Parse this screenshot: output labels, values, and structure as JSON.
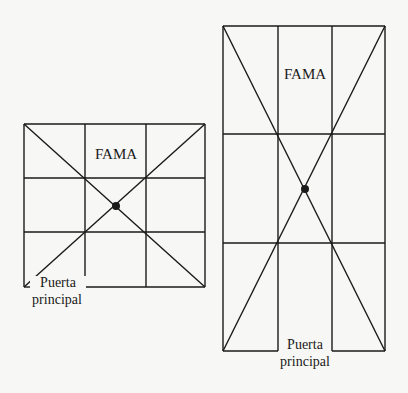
{
  "diagrams": [
    {
      "name": "square-plan",
      "top_label": "FAMA",
      "door_label_line1": "Puerta",
      "door_label_line2": "principal"
    },
    {
      "name": "rectangular-plan",
      "top_label": "FAMA",
      "door_label_line1": "Puerta",
      "door_label_line2": "principal"
    }
  ],
  "colors": {
    "line": "#1a1a1a",
    "background": "#f7f7f5"
  }
}
